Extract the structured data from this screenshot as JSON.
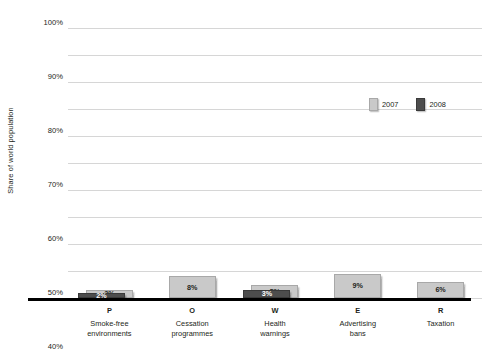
{
  "chart_data": {
    "type": "bar",
    "title": "",
    "subtitle": "",
    "xlabel": "",
    "ylabel": "Share of world population",
    "ylim": [
      0,
      100
    ],
    "y_tick_labels": [
      "0%",
      "10%",
      "20%",
      "30%",
      "40%",
      "50%",
      "60%",
      "70%",
      "80%",
      "90%",
      "100%"
    ],
    "y_tick_values": [
      0,
      10,
      20,
      30,
      40,
      50,
      60,
      70,
      80,
      90,
      100
    ],
    "grid": true,
    "legend_position": "upper right",
    "categories": [
      "Smoke-free environments",
      "Cessation programmes",
      "Health warnings",
      "Advertising bans",
      "Taxation"
    ],
    "category_letters": [
      "P",
      "O",
      "W",
      "E",
      "R"
    ],
    "category_name_lines": [
      [
        "Smoke-free",
        "environments"
      ],
      [
        "Cessation",
        "programmes"
      ],
      [
        "Health",
        "warnings"
      ],
      [
        "Advertising",
        "bans"
      ],
      [
        "Taxation"
      ]
    ],
    "series": [
      {
        "name": "2007",
        "color": "#c9c9c9",
        "values": [
          3,
          8,
          5,
          9,
          6
        ],
        "labels": [
          "3%",
          "8%",
          "5%",
          "9%",
          "6%"
        ]
      },
      {
        "name": "2008",
        "color": "#4d4d4d",
        "values": [
          2,
          null,
          3,
          null,
          null
        ],
        "labels": [
          "2%",
          "",
          "3%",
          "",
          ""
        ]
      }
    ]
  },
  "legend": {
    "items": [
      {
        "label": "2007",
        "color": "#c9c9c9"
      },
      {
        "label": "2008",
        "color": "#4d4d4d"
      }
    ]
  },
  "axis": {
    "y_title": "Share of world population"
  }
}
